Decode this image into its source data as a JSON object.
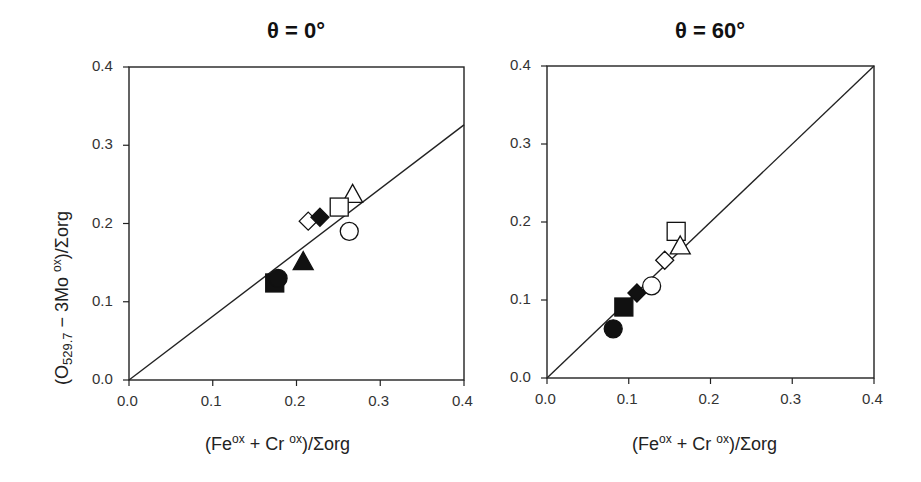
{
  "chart_data": [
    {
      "type": "scatter",
      "title": "θ = 0°",
      "xlabel": "(Fe ox + Cr ox)/Σorg",
      "ylabel": "(O529.7 − 3Mo ox)/Σorg",
      "xlim": [
        0.0,
        0.4
      ],
      "ylim": [
        0.0,
        0.4
      ],
      "xticks": [
        "0.0",
        "0.1",
        "0.2",
        "0.3",
        "0.4"
      ],
      "yticks": [
        "0.0",
        "0.1",
        "0.2",
        "0.3",
        "0.4"
      ],
      "grid": false,
      "legend": null,
      "fit_line": {
        "x": [
          0.0,
          0.4
        ],
        "y": [
          0.0,
          0.326
        ]
      },
      "series": [
        {
          "name": "open triangle",
          "marker": "triangle",
          "filled": false,
          "x": 0.267,
          "y": 0.236
        },
        {
          "name": "open square",
          "marker": "square",
          "filled": false,
          "x": 0.251,
          "y": 0.221
        },
        {
          "name": "open circle",
          "marker": "circle",
          "filled": false,
          "x": 0.263,
          "y": 0.19
        },
        {
          "name": "open diamond",
          "marker": "diamond",
          "filled": false,
          "x": 0.214,
          "y": 0.203
        },
        {
          "name": "filled diamond",
          "marker": "diamond",
          "filled": true,
          "x": 0.228,
          "y": 0.208
        },
        {
          "name": "filled triangle",
          "marker": "triangle",
          "filled": true,
          "x": 0.208,
          "y": 0.15
        },
        {
          "name": "filled square",
          "marker": "square",
          "filled": true,
          "x": 0.174,
          "y": 0.124
        },
        {
          "name": "filled circle",
          "marker": "circle",
          "filled": true,
          "x": 0.178,
          "y": 0.13
        }
      ]
    },
    {
      "type": "scatter",
      "title": "θ = 60°",
      "xlabel": "(Fe ox + Cr ox)/Σorg",
      "ylabel": "",
      "xlim": [
        0.0,
        0.4
      ],
      "ylim": [
        0.0,
        0.4
      ],
      "xticks": [
        "0.0",
        "0.1",
        "0.2",
        "0.3",
        "0.4"
      ],
      "yticks": [
        "0.0",
        "0.1",
        "0.2",
        "0.3",
        "0.4"
      ],
      "grid": false,
      "legend": null,
      "fit_line": {
        "x": [
          0.0,
          0.4
        ],
        "y": [
          0.0,
          0.4
        ]
      },
      "series": [
        {
          "name": "open square",
          "marker": "square",
          "filled": false,
          "x": 0.158,
          "y": 0.188
        },
        {
          "name": "open triangle",
          "marker": "triangle",
          "filled": false,
          "x": 0.163,
          "y": 0.168
        },
        {
          "name": "open diamond",
          "marker": "diamond",
          "filled": false,
          "x": 0.144,
          "y": 0.151
        },
        {
          "name": "open circle",
          "marker": "circle",
          "filled": false,
          "x": 0.128,
          "y": 0.118
        },
        {
          "name": "filled diamond",
          "marker": "diamond",
          "filled": true,
          "x": 0.11,
          "y": 0.109
        },
        {
          "name": "filled square",
          "marker": "square",
          "filled": true,
          "x": 0.094,
          "y": 0.091
        },
        {
          "name": "filled circle",
          "marker": "circle",
          "filled": true,
          "x": 0.081,
          "y": 0.063
        }
      ]
    }
  ],
  "labels": {
    "left_title": "θ = 0°",
    "right_title": "θ = 60°",
    "x_main_1": "(Fe",
    "x_sup_1": "ox",
    "x_main_2": " + Cr ",
    "x_sup_2": "ox",
    "x_main_3": ")/Σorg",
    "y_main_1": "(O",
    "y_sub": "529.7",
    "y_main_2": " − 3Mo ",
    "y_sup": "ox",
    "y_main_3": ")/Σorg"
  }
}
